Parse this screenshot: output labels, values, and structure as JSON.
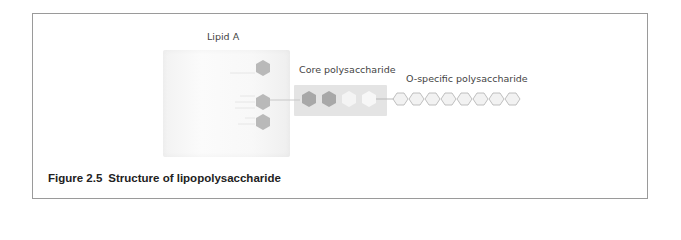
{
  "figure": {
    "number": "Figure 2.5",
    "title": "Structure of lipopolysaccharide"
  },
  "labels": {
    "lipid_a": "Lipid A",
    "core": "Core polysaccharide",
    "o_specific": "O-specific polysaccharide"
  },
  "lipid_a": {
    "hexagon_count": 3,
    "hexagon_color": "#b9b9b9"
  },
  "core": {
    "hexagons": [
      {
        "fill": "#a8a8a8"
      },
      {
        "fill": "#a8a8a8"
      },
      {
        "fill": "#f4f4f4"
      },
      {
        "fill": "#f7f7f7"
      }
    ],
    "box_color": "#e4e4e4"
  },
  "o_specific": {
    "hexagon_count": 8,
    "hexagon_fill": "#f2f2f2",
    "hexagon_stroke": "#b0b0b0"
  },
  "colors": {
    "frame_border": "#9a9a9a",
    "caption_text": "#222222",
    "label_text": "#444444"
  }
}
